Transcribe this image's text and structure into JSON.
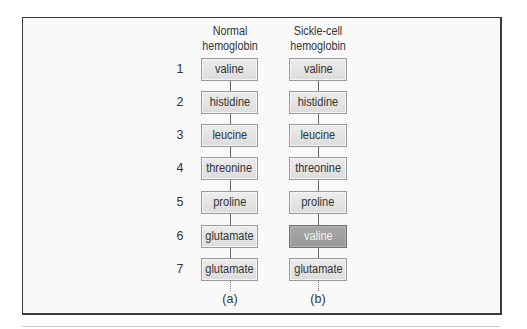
{
  "columns": [
    {
      "header_line1": "Normal",
      "header_line2": "hemoglobin",
      "label": "(a)"
    },
    {
      "header_line1": "Sickle-cell",
      "header_line2": "hemoglobin",
      "label": "(b)"
    }
  ],
  "rows": [
    {
      "num": "1",
      "normal": "valine",
      "sickle": "valine"
    },
    {
      "num": "2",
      "normal": "histidine",
      "sickle": "histidine"
    },
    {
      "num": "3",
      "normal": "leucine",
      "sickle": "leucine"
    },
    {
      "num": "4",
      "normal": "threonine",
      "sickle": "threonine"
    },
    {
      "num": "5",
      "normal": "proline",
      "sickle": "proline"
    },
    {
      "num": "6",
      "normal": "glutamate",
      "sickle": "valine"
    },
    {
      "num": "7",
      "normal": "glutamate",
      "sickle": "glutamate"
    }
  ],
  "highlight": {
    "column": "sickle",
    "row": 6,
    "color": "#a0a0a0"
  },
  "colors": {
    "box_fill": "#e4e4e4",
    "box_border": "#9a9a9a",
    "mutated_fill": "#a0a0a0",
    "frame": "#3a3a3a"
  }
}
